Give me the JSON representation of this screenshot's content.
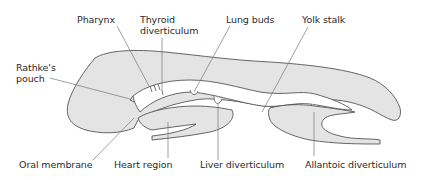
{
  "diagram": {
    "colors": {
      "tissue_fill": "#e4e4e4",
      "outline": "#555555",
      "leader_line": "#777777",
      "text": "#2b2b2b",
      "background": "#ffffff"
    },
    "labels": {
      "pharynx": "Pharynx",
      "thyroid_line1": "Thyroid",
      "thyroid_line2": "diverticulum",
      "lung_buds": "Lung buds",
      "yolk_stalk": "Yolk stalk",
      "rathke_line1": "Rathke's",
      "rathke_line2": "pouch",
      "oral_membrane": "Oral membrane",
      "heart_region": "Heart region",
      "liver_diverticulum": "Liver diverticulum",
      "allantoic_diverticulum": "Allantoic diverticulum"
    }
  }
}
